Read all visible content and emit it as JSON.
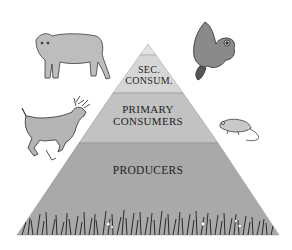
{
  "diagram": {
    "type": "trophic-pyramid",
    "levels": [
      {
        "name": "secondary-consumers",
        "line1": "SEC.",
        "line2": "CONSUM.",
        "color": "#d6d6d6"
      },
      {
        "name": "primary-consumers",
        "line1": "PRIMARY",
        "line2": "CONSUMERS",
        "color": "#c2c2c2"
      },
      {
        "name": "producers",
        "line1": "PRODUCERS",
        "color": "#a9a9a9"
      }
    ],
    "apex_color": "#e2e2e2",
    "animals": [
      {
        "name": "mountain-lion",
        "position": "top-left"
      },
      {
        "name": "owl",
        "position": "top-right"
      },
      {
        "name": "deer",
        "position": "middle-left"
      },
      {
        "name": "mouse",
        "position": "middle-right"
      }
    ],
    "base_decoration": "grass"
  }
}
